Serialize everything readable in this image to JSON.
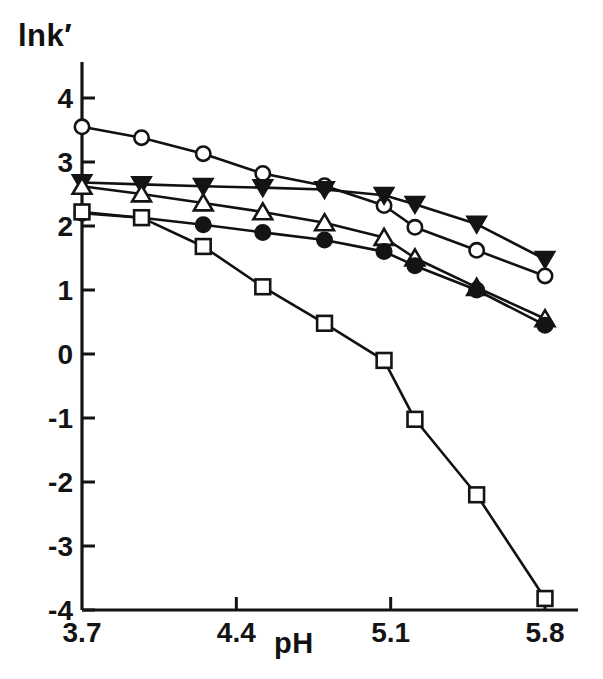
{
  "chart_data": {
    "type": "line",
    "title": "",
    "subtitle": "",
    "xlabel": "pH",
    "ylabel": "lnk′",
    "xlim": [
      3.7,
      5.8
    ],
    "ylim": [
      -4,
      4
    ],
    "xticks": [
      3.7,
      4.4,
      5.1,
      5.8
    ],
    "xticklabels": [
      "3.7",
      "4.4",
      "5.1",
      "5.8"
    ],
    "yticks": [
      -4,
      -3,
      -2,
      -1,
      0,
      1,
      2,
      3,
      4
    ],
    "yticklabels": [
      "-4",
      "-3",
      "-2",
      "-1",
      "0",
      "1",
      "2",
      "3",
      "4"
    ],
    "grid": false,
    "legend": "none",
    "legend_entries": [],
    "annotations": [],
    "x": [
      3.7,
      3.97,
      4.25,
      4.52,
      4.8,
      5.07,
      5.21,
      5.49,
      5.8
    ],
    "series": [
      {
        "name": "open-circle",
        "marker": "open-circle",
        "marker_fill": "#ffffff",
        "marker_edge": "#111111",
        "line_color": "#111111",
        "values": [
          3.55,
          3.38,
          3.13,
          2.82,
          2.63,
          2.32,
          1.98,
          1.62,
          1.22
        ]
      },
      {
        "name": "filled-triangle-down",
        "marker": "filled-triangle-down",
        "marker_fill": "#111111",
        "marker_edge": "#111111",
        "line_color": "#111111",
        "values": [
          2.68,
          2.65,
          2.62,
          2.6,
          2.57,
          2.48,
          2.34,
          2.03,
          1.48
        ]
      },
      {
        "name": "open-triangle-up",
        "marker": "open-triangle-up",
        "marker_fill": "#ffffff",
        "marker_edge": "#111111",
        "line_color": "#111111",
        "values": [
          2.62,
          2.5,
          2.36,
          2.22,
          2.05,
          1.82,
          1.5,
          1.04,
          0.55
        ]
      },
      {
        "name": "filled-circle",
        "marker": "filled-circle",
        "marker_fill": "#111111",
        "marker_edge": "#111111",
        "line_color": "#111111",
        "values": [
          2.2,
          2.13,
          2.02,
          1.9,
          1.78,
          1.6,
          1.38,
          1.0,
          0.45
        ]
      },
      {
        "name": "open-square",
        "marker": "open-square",
        "marker_fill": "#ffffff",
        "marker_edge": "#111111",
        "line_color": "#111111",
        "values": [
          2.22,
          2.13,
          1.68,
          1.05,
          0.48,
          -0.1,
          -1.02,
          -2.2,
          -3.82
        ]
      }
    ]
  },
  "axes": {
    "y_label_text": "lnk′",
    "x_label_text": "pH",
    "axis_color": "#111111"
  }
}
